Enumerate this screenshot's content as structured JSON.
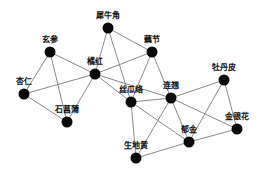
{
  "diagram": {
    "type": "network",
    "style": {
      "edge_color": "#8a8a8a",
      "node_color": "#0a0a0a",
      "background": "#ffffff"
    },
    "nodes": [
      {
        "id": "xiniujiao",
        "label": "犀牛角",
        "x": 108,
        "y": 28
      },
      {
        "id": "oujie",
        "label": "藕节",
        "x": 152,
        "y": 52
      },
      {
        "id": "xuanshen",
        "label": "玄参",
        "x": 50,
        "y": 52
      },
      {
        "id": "juhong",
        "label": "橘红",
        "x": 95,
        "y": 74
      },
      {
        "id": "xingren",
        "label": "杏仁",
        "x": 24,
        "y": 94
      },
      {
        "id": "shichangpu",
        "label": "石菖蒲",
        "x": 67,
        "y": 122
      },
      {
        "id": "sigualuo",
        "label": "丝瓜络",
        "x": 131,
        "y": 102
      },
      {
        "id": "lianqiao",
        "label": "连翘",
        "x": 171,
        "y": 98
      },
      {
        "id": "mudanpi",
        "label": "牡丹皮",
        "x": 224,
        "y": 80
      },
      {
        "id": "jinyinhua",
        "label": "金银花",
        "x": 237,
        "y": 129
      },
      {
        "id": "yujin",
        "label": "郁金",
        "x": 189,
        "y": 142
      },
      {
        "id": "shengdihuang",
        "label": "生地黄",
        "x": 136,
        "y": 158
      }
    ],
    "edges": [
      [
        "xiniujiao",
        "juhong"
      ],
      [
        "xiniujiao",
        "oujie"
      ],
      [
        "xiniujiao",
        "sigualuo"
      ],
      [
        "xuanshen",
        "juhong"
      ],
      [
        "xuanshen",
        "xingren"
      ],
      [
        "xuanshen",
        "shichangpu"
      ],
      [
        "juhong",
        "oujie"
      ],
      [
        "juhong",
        "xingren"
      ],
      [
        "juhong",
        "shichangpu"
      ],
      [
        "juhong",
        "sigualuo"
      ],
      [
        "juhong",
        "lianqiao"
      ],
      [
        "xingren",
        "shichangpu"
      ],
      [
        "oujie",
        "sigualuo"
      ],
      [
        "oujie",
        "lianqiao"
      ],
      [
        "sigualuo",
        "lianqiao"
      ],
      [
        "sigualuo",
        "yujin"
      ],
      [
        "sigualuo",
        "shengdihuang"
      ],
      [
        "lianqiao",
        "mudanpi"
      ],
      [
        "lianqiao",
        "yujin"
      ],
      [
        "lianqiao",
        "jinyinhua"
      ],
      [
        "lianqiao",
        "shengdihuang"
      ],
      [
        "mudanpi",
        "yujin"
      ],
      [
        "mudanpi",
        "jinyinhua"
      ],
      [
        "yujin",
        "jinyinhua"
      ],
      [
        "yujin",
        "shengdihuang"
      ]
    ]
  }
}
